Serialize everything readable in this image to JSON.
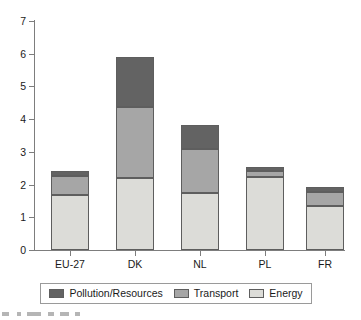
{
  "chart_data": {
    "type": "bar",
    "subtype": "stacked-bar",
    "title": "",
    "subtitle": "",
    "xlabel": "",
    "ylabel": "",
    "categories": [
      "EU-27",
      "DK",
      "NL",
      "PL",
      "FR"
    ],
    "series": [
      {
        "name": "Energy",
        "color": "#dcdcd8",
        "values": [
          1.68,
          2.2,
          1.74,
          2.23,
          1.35
        ]
      },
      {
        "name": "Transport",
        "color": "#a6a6a6",
        "values": [
          0.57,
          2.17,
          1.35,
          0.19,
          0.43
        ]
      },
      {
        "name": "Pollution/Resources",
        "color": "#636363",
        "values": [
          0.17,
          1.52,
          0.73,
          0.12,
          0.15
        ]
      }
    ],
    "stack_order_bottom_to_top": [
      "Energy",
      "Transport",
      "Pollution/Resources"
    ],
    "totals": [
      2.42,
      5.89,
      3.82,
      2.54,
      1.93
    ],
    "ylim": [
      0,
      7
    ],
    "ytick_values": [
      0,
      1,
      2,
      3,
      4,
      5,
      6,
      7
    ],
    "ytick_labels": [
      "0",
      "1",
      "2",
      "3",
      "4",
      "5",
      "6",
      "7"
    ],
    "grid": false,
    "legend_position": "bottom",
    "legend_entries": [
      "Pollution/Resources",
      "Transport",
      "Energy"
    ],
    "annotations": []
  },
  "axes": {
    "y_ticks": [
      {
        "label": "7",
        "value": 7
      },
      {
        "label": "6",
        "value": 6
      },
      {
        "label": "5",
        "value": 5
      },
      {
        "label": "4",
        "value": 4
      },
      {
        "label": "3",
        "value": 3
      },
      {
        "label": "2",
        "value": 2
      },
      {
        "label": "1",
        "value": 1
      },
      {
        "label": "0",
        "value": 0
      }
    ],
    "x_ticks": [
      {
        "label": "EU-27"
      },
      {
        "label": "DK"
      },
      {
        "label": "NL"
      },
      {
        "label": "PL"
      },
      {
        "label": "FR"
      }
    ]
  },
  "legend": {
    "items": [
      {
        "label": "Pollution/Resources",
        "color": "#636363"
      },
      {
        "label": "Transport",
        "color": "#a6a6a6"
      },
      {
        "label": "Energy",
        "color": "#dcdcd8"
      }
    ]
  },
  "colors": {
    "pollution": "#636363",
    "transport": "#a6a6a6",
    "energy": "#dcdcd8",
    "axis": "#7d7d7d",
    "bar_outline": "#5e5e5e",
    "text": "#1a1a1a",
    "background": "#ffffff"
  }
}
